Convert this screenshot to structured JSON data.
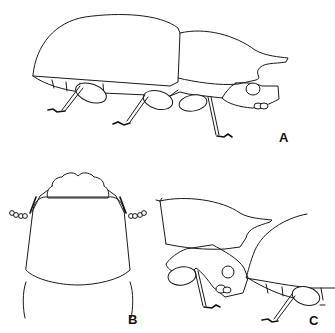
{
  "figure": {
    "panels": [
      {
        "id": "A",
        "label": "A",
        "view": "lateral view, whole body"
      },
      {
        "id": "B",
        "label": "B",
        "view": "dorsal view, pronotum and head"
      },
      {
        "id": "C",
        "label": "C",
        "view": "lateral view, pronotum detail"
      }
    ]
  }
}
